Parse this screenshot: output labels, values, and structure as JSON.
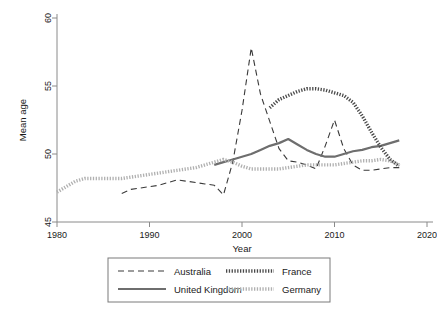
{
  "chart_data": {
    "type": "line",
    "title": "",
    "xlabel": "Year",
    "ylabel": "Mean age",
    "xlim": [
      1980,
      2020
    ],
    "ylim": [
      45,
      60
    ],
    "xticks": [
      1980,
      1990,
      2000,
      2010,
      2020
    ],
    "yticks": [
      45,
      50,
      55,
      60
    ],
    "grid": false,
    "legend_position": "bottom",
    "series": [
      {
        "name": "Australia",
        "style": "dashed",
        "color": "#3a3a3a",
        "width": 1.1,
        "x": [
          1987,
          1988,
          1989,
          1990,
          1991,
          1992,
          1993,
          1994,
          1995,
          1996,
          1997,
          1998,
          1999,
          2000,
          2001,
          2002,
          2003,
          2004,
          2005,
          2006,
          2007,
          2008,
          2009,
          2010,
          2011,
          2012,
          2013,
          2014,
          2015,
          2016,
          2017
        ],
        "y": [
          47.1,
          47.4,
          47.5,
          47.6,
          47.7,
          47.9,
          48.1,
          48.0,
          47.9,
          47.8,
          47.7,
          47.0,
          49.4,
          53.2,
          57.8,
          54.4,
          52.4,
          50.4,
          49.5,
          49.4,
          49.2,
          48.9,
          50.6,
          52.5,
          50.4,
          49.2,
          48.8,
          48.8,
          48.9,
          49.0,
          49.0
        ]
      },
      {
        "name": "United Kingdom",
        "style": "solid",
        "color": "#6e6e6e",
        "width": 2.2,
        "x": [
          1997,
          1998,
          1999,
          2000,
          2001,
          2002,
          2003,
          2004,
          2005,
          2006,
          2007,
          2008,
          2009,
          2010,
          2011,
          2012,
          2013,
          2014,
          2015,
          2016,
          2017
        ],
        "y": [
          49.2,
          49.4,
          49.6,
          49.8,
          50.0,
          50.3,
          50.6,
          50.8,
          51.1,
          50.7,
          50.3,
          50.0,
          49.8,
          49.8,
          50.0,
          50.2,
          50.3,
          50.5,
          50.6,
          50.8,
          51.0
        ]
      },
      {
        "name": "France",
        "style": "dotted",
        "color": "#4a4a4a",
        "width": 3.4,
        "x": [
          2003,
          2004,
          2005,
          2006,
          2007,
          2008,
          2009,
          2010,
          2011,
          2012,
          2013,
          2014,
          2015,
          2016,
          2017
        ],
        "y": [
          53.4,
          54.0,
          54.3,
          54.6,
          54.8,
          54.8,
          54.7,
          54.5,
          54.3,
          53.8,
          52.8,
          51.6,
          50.5,
          49.6,
          49.1
        ]
      },
      {
        "name": "Germany",
        "style": "dotted",
        "color": "#b0b0b0",
        "width": 3.4,
        "x": [
          1980,
          1981,
          1982,
          1983,
          1984,
          1985,
          1986,
          1987,
          1988,
          1989,
          1990,
          1991,
          1992,
          1993,
          1994,
          1995,
          1996,
          1997,
          1998,
          1999,
          2000,
          2001,
          2002,
          2003,
          2004,
          2005,
          2006,
          2007,
          2008,
          2009,
          2010,
          2011,
          2012,
          2013,
          2014,
          2015,
          2016,
          2017
        ],
        "y": [
          47.2,
          47.6,
          48.0,
          48.2,
          48.2,
          48.2,
          48.2,
          48.2,
          48.3,
          48.4,
          48.5,
          48.6,
          48.7,
          48.8,
          48.9,
          49.0,
          49.2,
          49.4,
          49.6,
          49.4,
          49.1,
          48.9,
          48.9,
          48.9,
          48.9,
          49.0,
          49.1,
          49.2,
          49.2,
          49.2,
          49.2,
          49.3,
          49.4,
          49.5,
          49.5,
          49.6,
          49.5,
          49.2
        ]
      }
    ]
  },
  "legend": {
    "entries": [
      {
        "label": "Australia",
        "key": "dashed-dark-thin"
      },
      {
        "label": "France",
        "key": "dotted-dark-thick"
      },
      {
        "label": "United Kingdom",
        "key": "solid-gray-thick"
      },
      {
        "label": "Germany",
        "key": "dotted-light-thick"
      }
    ]
  }
}
